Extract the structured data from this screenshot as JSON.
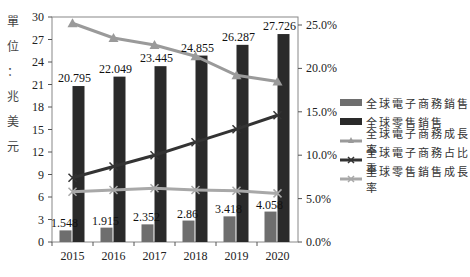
{
  "chart_data": {
    "type": "bar+line",
    "title": "",
    "ylabel": "單位：兆美元",
    "ylabel_chars": [
      "單",
      "位",
      "：",
      "兆",
      "美",
      "元"
    ],
    "xlabel": "",
    "categories": [
      "2015",
      "2016",
      "2017",
      "2018",
      "2019",
      "2020"
    ],
    "left_axis": {
      "ylim": [
        0,
        30
      ],
      "ticks": [
        0,
        3,
        6,
        9,
        12,
        15,
        18,
        21,
        24,
        27,
        30
      ]
    },
    "right_axis": {
      "ylim": [
        0,
        25
      ],
      "ticks": [
        "0.0%",
        "5.0%",
        "10.0%",
        "15.0%",
        "20.0%",
        "25.0%"
      ]
    },
    "series": [
      {
        "name": "全球電子商務銷售",
        "type": "bar",
        "axis": "left",
        "color": "#6e6e6e",
        "values": [
          1.548,
          1.915,
          2.352,
          2.86,
          3.418,
          4.058
        ],
        "labels": [
          "1.548",
          "1.915",
          "2.352",
          "2.86",
          "3.418",
          "4.058"
        ]
      },
      {
        "name": "全球零售銷售",
        "type": "bar",
        "axis": "left",
        "color": "#2a2a2a",
        "values": [
          20.795,
          22.049,
          23.445,
          24.855,
          26.287,
          27.726
        ],
        "labels": [
          "20.795",
          "22.049",
          "23.445",
          "24.855",
          "26.287",
          "27.726"
        ]
      },
      {
        "name": "全球電子商務成長率",
        "type": "line",
        "axis": "right",
        "marker": "triangle",
        "color": "#9a9a9a",
        "values": [
          25.2,
          23.5,
          22.7,
          21.4,
          19.2,
          18.5
        ]
      },
      {
        "name": "全球電子商務占比重",
        "type": "line",
        "axis": "right",
        "marker": "x",
        "color": "#333333",
        "values": [
          7.4,
          8.7,
          10.0,
          11.5,
          13.0,
          14.6
        ]
      },
      {
        "name": "全球零售銷售成長率",
        "type": "line",
        "axis": "right",
        "marker": "x",
        "color": "#a8a8a8",
        "values": [
          5.8,
          6.0,
          6.2,
          6.0,
          5.9,
          5.6
        ]
      }
    ],
    "legend_position": "right",
    "grid": false
  }
}
